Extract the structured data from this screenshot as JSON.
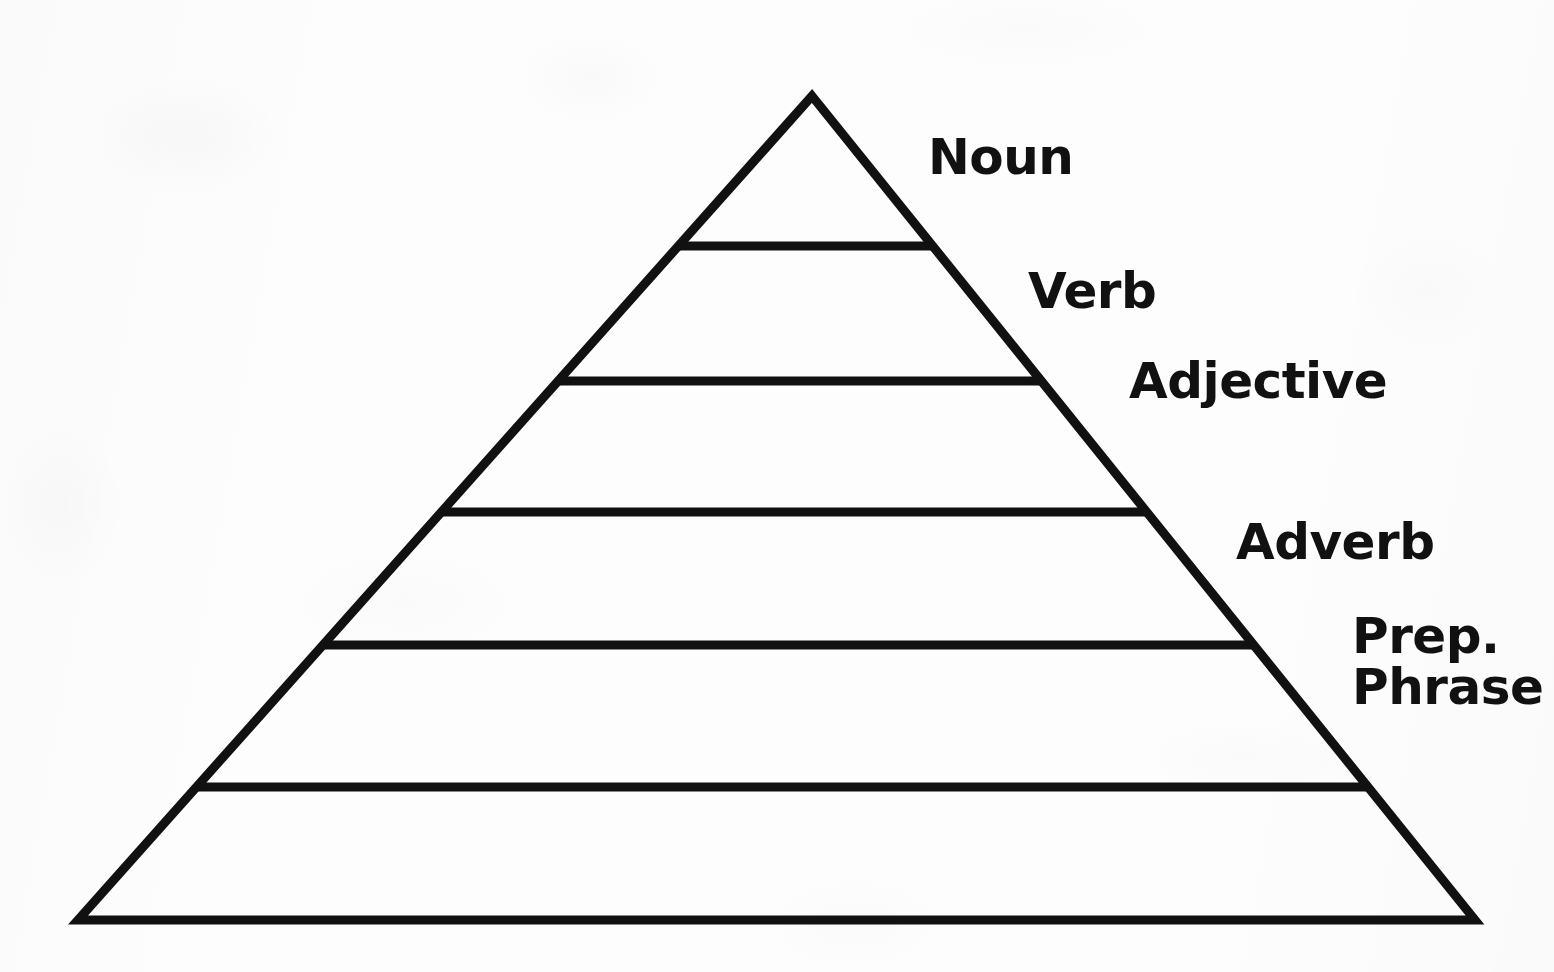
{
  "figure": {
    "type": "pyramid-diagram",
    "background_color": "#fdfdfd",
    "stroke_color": "#111111",
    "stroke_width_px": 9,
    "apex": {
      "x": 812,
      "y": 96
    },
    "base_left": {
      "x": 78,
      "y": 920
    },
    "base_right": {
      "x": 1475,
      "y": 920
    },
    "divider_y_positions": [
      246,
      381,
      512,
      645,
      787
    ]
  },
  "levels": [
    {
      "index": 1,
      "label": "Noun",
      "band_top_y": 96,
      "band_bottom_y": 246,
      "label_x": 928,
      "label_y": 132,
      "font_size": 50
    },
    {
      "index": 2,
      "label": "Verb",
      "band_top_y": 246,
      "band_bottom_y": 381,
      "label_x": 1028,
      "label_y": 266,
      "font_size": 50
    },
    {
      "index": 3,
      "label": "Adjective",
      "band_top_y": 381,
      "band_bottom_y": 512,
      "label_x": 1129,
      "label_y": 356,
      "font_size": 50
    },
    {
      "index": 4,
      "label": "Adverb",
      "band_top_y": 512,
      "band_bottom_y": 645,
      "label_x": 1236,
      "label_y": 517,
      "font_size": 50
    },
    {
      "index": 5,
      "label": "Prep. Phrase",
      "label_line1": "Prep.",
      "label_line2": "Phrase",
      "band_top_y": 645,
      "band_bottom_y": 787,
      "label_x": 1352,
      "label_y": 611,
      "font_size": 50
    },
    {
      "index": 6,
      "label": "",
      "band_top_y": 787,
      "band_bottom_y": 920,
      "font_size": 50
    }
  ],
  "chart_data": {
    "type": "pyramid",
    "title": "",
    "orientation": "apex-up",
    "categories": [
      "Noun",
      "Verb",
      "Adjective",
      "Adverb",
      "Prep. Phrase",
      ""
    ],
    "values": [
      1,
      2,
      3,
      4,
      5,
      6
    ],
    "band_boundaries_y": [
      96,
      246,
      381,
      512,
      645,
      787,
      920
    ],
    "legend": "none",
    "grid": false,
    "xlabel": "",
    "ylabel": ""
  }
}
